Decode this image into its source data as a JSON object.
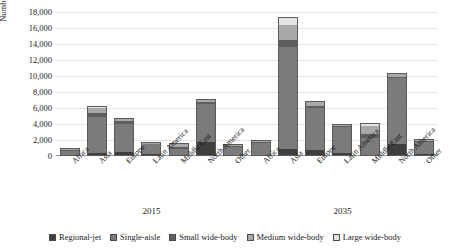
{
  "chart_data": {
    "type": "bar",
    "subtype": "stacked-bar-grouped",
    "title": "",
    "xlabel": "",
    "ylabel": "Number of aircraft",
    "ylim": [
      0,
      18000
    ],
    "ytick_labels": [
      "18,000",
      "16,000",
      "14,000",
      "12,000",
      "10,000",
      "8,000",
      "6,000",
      "4,000",
      "2,000",
      "0"
    ],
    "ytick_values": [
      18000,
      16000,
      14000,
      12000,
      10000,
      8000,
      6000,
      4000,
      2000,
      0
    ],
    "grid": true,
    "legend_position": "bottom",
    "groups": [
      "2015",
      "2035"
    ],
    "categories": [
      "Africa",
      "Asia",
      "Europe",
      "Latin America",
      "Middle East",
      "North America",
      "Other"
    ],
    "series": [
      {
        "name": "Regional-jet",
        "color": "#3f3f3f",
        "values_2015": [
          120,
          380,
          520,
          190,
          60,
          1750,
          120
        ],
        "values_2035": [
          180,
          900,
          700,
          330,
          120,
          1500,
          200
        ]
      },
      {
        "name": "Single-aisle",
        "color": "#7b7b7b",
        "values_2015": [
          560,
          4500,
          3500,
          1250,
          800,
          4700,
          1000
        ],
        "values_2035": [
          1430,
          12700,
          5300,
          3300,
          2150,
          8200,
          1550
        ]
      },
      {
        "name": "Small wide-body",
        "color": "#5e5e5e",
        "values_2015": [
          60,
          480,
          330,
          60,
          230,
          330,
          60
        ],
        "values_2035": [
          100,
          900,
          300,
          100,
          480,
          200,
          100
        ]
      },
      {
        "name": "Medium wide-body",
        "color": "#a9a9a9",
        "values_2015": [
          60,
          640,
          310,
          60,
          380,
          230,
          60
        ],
        "values_2035": [
          110,
          1900,
          500,
          120,
          950,
          380,
          100
        ]
      },
      {
        "name": "Large wide-body",
        "color": "#e3e3e3",
        "values_2015": [
          20,
          300,
          60,
          20,
          130,
          60,
          20
        ],
        "values_2035": [
          40,
          1000,
          120,
          30,
          400,
          100,
          40
        ]
      }
    ],
    "totals_2015": [
      820,
      6300,
      4720,
      1580,
      1600,
      7070,
      1260
    ],
    "totals_2035": [
      1860,
      17400,
      6920,
      3880,
      4100,
      10380,
      1990
    ]
  }
}
